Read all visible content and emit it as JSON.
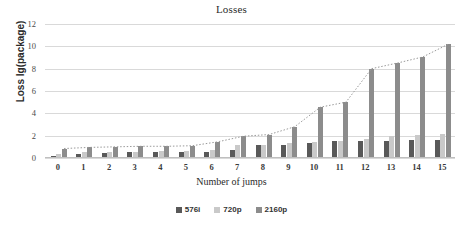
{
  "chart_data": {
    "type": "bar",
    "title": "Losses",
    "xlabel": "Number of jumps",
    "ylabel": "Loss lg(package)",
    "categories": [
      "0",
      "1",
      "2",
      "3",
      "4",
      "5",
      "6",
      "7",
      "8",
      "9",
      "10",
      "11",
      "12",
      "13",
      "14",
      "15"
    ],
    "ylim": [
      0,
      12
    ],
    "yticks": [
      "0",
      "2",
      "4",
      "6",
      "8",
      "10",
      "12"
    ],
    "grid": true,
    "legend_position": "bottom",
    "series": [
      {
        "name": "576i",
        "color": "#595959",
        "values": [
          0.2,
          0.4,
          0.45,
          0.5,
          0.55,
          0.55,
          0.55,
          0.75,
          1.15,
          1.2,
          1.3,
          1.5,
          1.5,
          1.55,
          1.6,
          1.6
        ]
      },
      {
        "name": "720p",
        "color": "#c9c9c9",
        "values": [
          0.35,
          0.5,
          0.5,
          0.55,
          0.6,
          0.6,
          0.7,
          1.15,
          1.2,
          1.3,
          1.4,
          1.5,
          1.7,
          2.0,
          2.05,
          2.15
        ]
      },
      {
        "name": "2160p",
        "color": "#8c8c8c",
        "values": [
          0.85,
          0.95,
          1.0,
          1.05,
          1.05,
          1.1,
          1.45,
          1.95,
          2.1,
          2.8,
          4.55,
          5.0,
          8.0,
          8.5,
          9.05,
          10.2
        ]
      }
    ],
    "trendline": {
      "name": "2160p-trend",
      "style": "dotted",
      "color": "#9a9a9a",
      "values": [
        0.85,
        0.95,
        1.0,
        1.05,
        1.05,
        1.1,
        1.45,
        1.95,
        2.1,
        2.8,
        4.55,
        5.0,
        8.0,
        8.5,
        9.05,
        10.2
      ]
    }
  }
}
